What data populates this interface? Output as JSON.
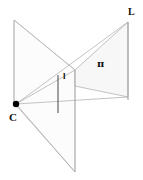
{
  "figure": {
    "background_color": "#ffffff",
    "line_color": "#9a9a9a",
    "fill_color": "#fafafa",
    "label_color": "#111111",
    "width": 143,
    "height": 180,
    "labels": {
      "camera_center": "C",
      "world_line": "L",
      "world_plane": "π",
      "image_line": "l"
    },
    "geometry": {
      "camera_center_point": {
        "x": 16,
        "y": 104,
        "radius": 3.2
      },
      "image_plane_polygon": "14,20 75,70 75,172 14,103",
      "world_plane_polygon": "75,70 128,22 128,97 75,86",
      "world_line_segment": {
        "x1": 128,
        "y1": 22,
        "x2": 128,
        "y2": 100
      },
      "image_line_segment": {
        "x1": 58,
        "y1": 75,
        "x2": 58,
        "y2": 113
      },
      "projection_rays": [
        {
          "x1": 16,
          "y1": 104,
          "x2": 128,
          "y2": 22
        },
        {
          "x1": 16,
          "y1": 104,
          "x2": 128,
          "y2": 97
        },
        {
          "x1": 16,
          "y1": 104,
          "x2": 75,
          "y2": 70
        },
        {
          "x1": 16,
          "y1": 104,
          "x2": 75,
          "y2": 172
        }
      ]
    }
  }
}
